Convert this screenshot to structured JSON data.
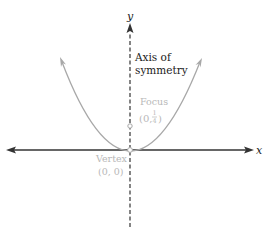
{
  "diagram": {
    "axes": {
      "x_label": "x",
      "y_label": "y"
    },
    "labels": {
      "axis_of_symmetry_line1": "Axis of",
      "axis_of_symmetry_line2": "symmetry",
      "focus": "Focus",
      "focus_coord_open": "(0,",
      "focus_coord_num": "1",
      "focus_coord_den": "4",
      "focus_coord_close": ")",
      "vertex": "Vertex",
      "vertex_coord": "(0, 0)"
    },
    "points": [
      {
        "name": "Vertex",
        "x": 0,
        "y": 0
      },
      {
        "name": "Focus",
        "x": 0,
        "y": 0.25
      }
    ],
    "colors": {
      "axis": "#333333",
      "curve": "#a8a8a8",
      "gray_label": "#b8b8b8",
      "dark_label": "#1a1a1a"
    }
  }
}
